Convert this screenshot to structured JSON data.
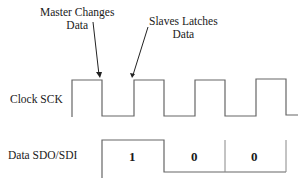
{
  "annotations": {
    "master": {
      "line1": "Master Changes",
      "line2": "Data"
    },
    "slave": {
      "line1": "Slaves Latches",
      "line2": "Data"
    }
  },
  "signals": {
    "clock": {
      "label": "Clock SCK"
    },
    "data": {
      "label": "Data SDO/SDI",
      "bits": [
        "1",
        "0",
        "0"
      ]
    }
  },
  "colors": {
    "line": "#555555",
    "text": "#1a1a1a"
  }
}
